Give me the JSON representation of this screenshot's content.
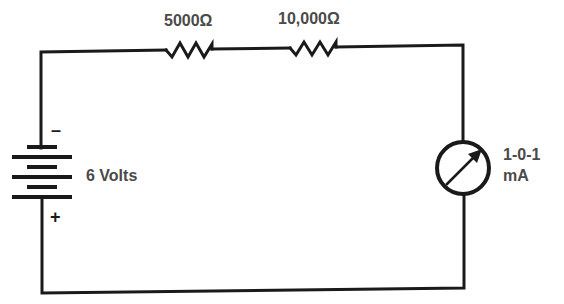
{
  "diagram": {
    "type": "series circuit",
    "components": {
      "resistor_1": {
        "label": "5000Ω"
      },
      "resistor_2": {
        "label": "10,000Ω"
      },
      "battery": {
        "label": "6 Volts",
        "negative_sign": "–",
        "positive_sign": "+"
      },
      "meter": {
        "label_line1": "1-0-1",
        "label_line2": "mA"
      }
    },
    "colors": {
      "wire": "#1a1a1a",
      "label_text": "#4a4a4a",
      "background": "#ffffff"
    }
  }
}
